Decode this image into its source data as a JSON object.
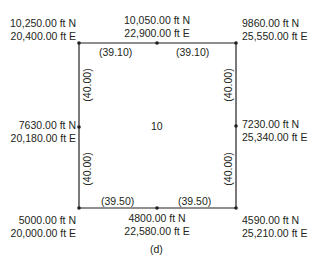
{
  "figure": {
    "caption": "(d)",
    "area_label": "10",
    "line_color": "#231f20",
    "points": {
      "top_left": {
        "north": "10,250.00 ft N",
        "east": "20,400.00 ft E"
      },
      "top_mid": {
        "north": "10,050.00 ft N",
        "east": "22,900.00 ft E"
      },
      "top_right": {
        "north": "9860.00 ft N",
        "east": "25,550.00 ft E"
      },
      "mid_left": {
        "north": "7630.00 ft N",
        "east": "20,180.00 ft E"
      },
      "mid_right": {
        "north": "7230.00 ft N",
        "east": "25,340.00 ft E"
      },
      "bottom_left": {
        "north": "5000.00 ft N",
        "east": "20,000.00 ft E"
      },
      "bottom_mid": {
        "north": "4800.00 ft N",
        "east": "22,580.00 ft E"
      },
      "bottom_right": {
        "north": "4590.00 ft N",
        "east": "25,210.00 ft E"
      }
    },
    "distances": {
      "top_left_segment": "(39.10)",
      "top_right_segment": "(39.10)",
      "bottom_left_segment": "(39.50)",
      "bottom_right_segment": "(39.50)",
      "left_upper_segment": "(40.00)",
      "left_lower_segment": "(40.00)",
      "right_upper_segment": "(40.00)",
      "right_lower_segment": "(40.00)"
    }
  }
}
